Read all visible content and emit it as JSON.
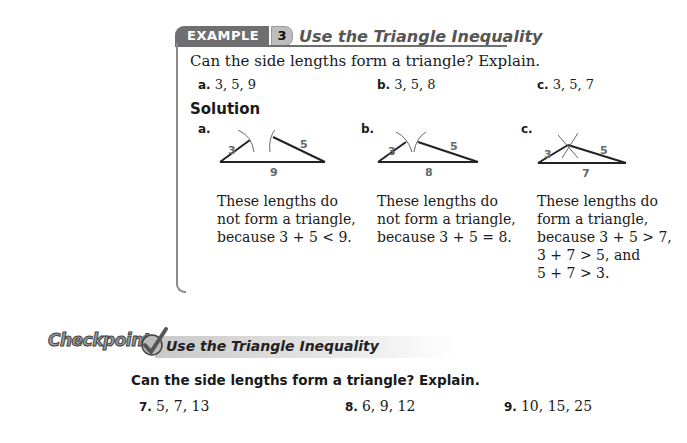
{
  "example": {
    "tab_label": "EXAMPLE",
    "number": "3",
    "title": "Use the Triangle Inequality",
    "question": "Can the side lengths form a triangle? Explain.",
    "items": [
      {
        "label": "a.",
        "value": "3, 5, 9"
      },
      {
        "label": "b.",
        "value": "3, 5, 8"
      },
      {
        "label": "c.",
        "value": "3, 5, 7"
      }
    ],
    "solution_heading": "Solution",
    "solutions": [
      {
        "label": "a.",
        "sides": {
          "left": "3",
          "right": "5",
          "base": "9"
        },
        "lines": [
          "These lengths do",
          "not form a triangle,",
          "because 3 + 5 < 9."
        ]
      },
      {
        "label": "b.",
        "sides": {
          "left": "3",
          "right": "5",
          "base": "8"
        },
        "lines": [
          "These lengths do",
          "not form a triangle,",
          "because 3 + 5 = 8."
        ]
      },
      {
        "label": "c.",
        "sides": {
          "left": "3",
          "right": "5",
          "base": "7"
        },
        "lines": [
          "These lengths do",
          "form a triangle,",
          "because 3 + 5 > 7,",
          "3 + 7 > 5, and",
          "5 + 7 > 3."
        ]
      }
    ]
  },
  "checkpoint": {
    "logo": "Checkpoint",
    "title": "Use the Triangle Inequality",
    "question": "Can the side lengths form a triangle? Explain.",
    "exercises": [
      {
        "label": "7.",
        "value": "5, 7, 13"
      },
      {
        "label": "8.",
        "value": "6, 9, 12"
      },
      {
        "label": "9.",
        "value": "10, 15, 25"
      }
    ]
  }
}
